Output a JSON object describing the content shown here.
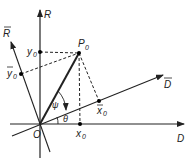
{
  "diagram": {
    "axes": {
      "R": "R",
      "R_bar": "R",
      "D": "D",
      "D_bar": "D"
    },
    "points": {
      "origin": "O",
      "P0": "P",
      "P0_sub": "0",
      "x0": "x",
      "x0_sub": "0",
      "y0": "y",
      "y0_sub": "0",
      "xbar0": "x",
      "xbar0_sub": "0",
      "ybar0": "y",
      "ybar0_sub": "0"
    },
    "angles": {
      "theta": "θ",
      "psi": "ψ"
    },
    "colors": {
      "ink": "#222222",
      "background": "#ffffff"
    }
  }
}
